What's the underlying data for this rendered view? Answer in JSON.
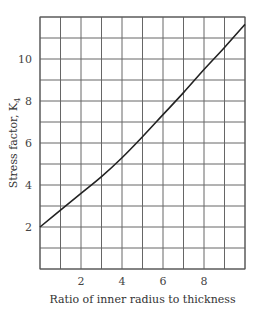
{
  "chart_data": {
    "type": "line",
    "title": "",
    "xlabel": "Ratio of inner radius to thickness",
    "ylabel": "Stress factor, K",
    "ylabel_subscript": "4",
    "xlim": [
      0,
      10
    ],
    "ylim": [
      0,
      12
    ],
    "x_ticks": [
      2,
      4,
      6,
      8
    ],
    "y_ticks": [
      2,
      4,
      6,
      8,
      10
    ],
    "grid": true,
    "grid_x_step": 1,
    "grid_y_step": 1,
    "legend": null,
    "series": [
      {
        "name": "K4",
        "x": [
          0,
          1,
          2,
          3,
          4,
          5,
          6,
          7,
          8,
          9,
          10
        ],
        "values": [
          2.0,
          2.8,
          3.6,
          4.4,
          5.3,
          6.3,
          7.35,
          8.4,
          9.5,
          10.55,
          11.65
        ]
      }
    ]
  }
}
